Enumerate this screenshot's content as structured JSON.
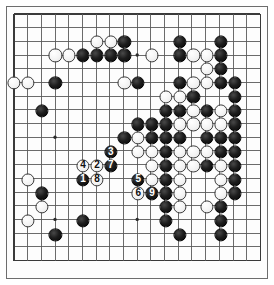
{
  "figure": {
    "kind": "go-board-diagram",
    "board_size": 19,
    "colors": {
      "board_background": "#fdfdfd",
      "page_background": "#ffffff",
      "grid_line": "#5a5a5a",
      "border": "#6d6d6d",
      "black_stone": "#141414",
      "white_stone": "#f7f7f7",
      "black_label_text": "#ffffff",
      "white_label_text": "#111111"
    },
    "geometry": {
      "left_px": 13,
      "top_px": 13,
      "spacing_px": 13.8,
      "stone_diameter_px": 13.2,
      "star_radius_px": 1.7
    },
    "star_points": [
      {
        "col": 4,
        "row": 4
      },
      {
        "col": 10,
        "row": 4
      },
      {
        "col": 16,
        "row": 4
      },
      {
        "col": 4,
        "row": 10
      },
      {
        "col": 10,
        "row": 10
      },
      {
        "col": 16,
        "row": 10
      },
      {
        "col": 4,
        "row": 16
      },
      {
        "col": 10,
        "row": 16
      },
      {
        "col": 16,
        "row": 16
      }
    ]
  },
  "stones": {
    "black": [
      {
        "col": 9,
        "row": 3
      },
      {
        "col": 13,
        "row": 3
      },
      {
        "col": 16,
        "row": 3
      },
      {
        "col": 6,
        "row": 4
      },
      {
        "col": 7,
        "row": 4
      },
      {
        "col": 8,
        "row": 4
      },
      {
        "col": 9,
        "row": 4
      },
      {
        "col": 13,
        "row": 4
      },
      {
        "col": 16,
        "row": 4
      },
      {
        "col": 16,
        "row": 5
      },
      {
        "col": 4,
        "row": 6
      },
      {
        "col": 13,
        "row": 6
      },
      {
        "col": 10,
        "row": 6
      },
      {
        "col": 17,
        "row": 6
      },
      {
        "col": 17,
        "row": 7
      },
      {
        "col": 14,
        "row": 7
      },
      {
        "col": 3,
        "row": 8
      },
      {
        "col": 12,
        "row": 8
      },
      {
        "col": 13,
        "row": 8
      },
      {
        "col": 15,
        "row": 8
      },
      {
        "col": 17,
        "row": 8
      },
      {
        "col": 11,
        "row": 9
      },
      {
        "col": 12,
        "row": 9
      },
      {
        "col": 17,
        "row": 9
      },
      {
        "col": 10,
        "row": 9
      },
      {
        "col": 11,
        "row": 10
      },
      {
        "col": 12,
        "row": 10
      },
      {
        "col": 13,
        "row": 10
      },
      {
        "col": 15,
        "row": 10
      },
      {
        "col": 16,
        "row": 10
      },
      {
        "col": 17,
        "row": 10
      },
      {
        "col": 9,
        "row": 10
      },
      {
        "col": 12,
        "row": 11
      },
      {
        "col": 16,
        "row": 11
      },
      {
        "col": 17,
        "row": 11
      },
      {
        "col": 12,
        "row": 12
      },
      {
        "col": 15,
        "row": 12
      },
      {
        "col": 17,
        "row": 12
      },
      {
        "col": 12,
        "row": 13
      },
      {
        "col": 17,
        "row": 13
      },
      {
        "col": 12,
        "row": 14
      },
      {
        "col": 17,
        "row": 14
      },
      {
        "col": 12,
        "row": 15
      },
      {
        "col": 16,
        "row": 15
      },
      {
        "col": 12,
        "row": 16
      },
      {
        "col": 16,
        "row": 16
      },
      {
        "col": 13,
        "row": 17
      },
      {
        "col": 16,
        "row": 17
      },
      {
        "col": 3,
        "row": 14
      },
      {
        "col": 16,
        "row": 6
      },
      {
        "col": 6,
        "row": 16
      },
      {
        "col": 4,
        "row": 17
      }
    ],
    "white": [
      {
        "col": 7,
        "row": 3
      },
      {
        "col": 8,
        "row": 3
      },
      {
        "col": 4,
        "row": 4
      },
      {
        "col": 5,
        "row": 4
      },
      {
        "col": 11,
        "row": 4
      },
      {
        "col": 14,
        "row": 4
      },
      {
        "col": 15,
        "row": 4
      },
      {
        "col": 15,
        "row": 5
      },
      {
        "col": 1,
        "row": 6
      },
      {
        "col": 2,
        "row": 6
      },
      {
        "col": 12,
        "row": 7
      },
      {
        "col": 13,
        "row": 7
      },
      {
        "col": 9,
        "row": 6
      },
      {
        "col": 14,
        "row": 6
      },
      {
        "col": 15,
        "row": 6
      },
      {
        "col": 14,
        "row": 8
      },
      {
        "col": 16,
        "row": 8
      },
      {
        "col": 13,
        "row": 9
      },
      {
        "col": 14,
        "row": 9
      },
      {
        "col": 15,
        "row": 9
      },
      {
        "col": 16,
        "row": 9
      },
      {
        "col": 10,
        "row": 11
      },
      {
        "col": 11,
        "row": 11
      },
      {
        "col": 13,
        "row": 11
      },
      {
        "col": 14,
        "row": 11
      },
      {
        "col": 15,
        "row": 11
      },
      {
        "col": 11,
        "row": 12
      },
      {
        "col": 13,
        "row": 12
      },
      {
        "col": 14,
        "row": 12
      },
      {
        "col": 16,
        "row": 12
      },
      {
        "col": 11,
        "row": 13
      },
      {
        "col": 13,
        "row": 13
      },
      {
        "col": 16,
        "row": 13
      },
      {
        "col": 13,
        "row": 14
      },
      {
        "col": 16,
        "row": 14
      },
      {
        "col": 13,
        "row": 15
      },
      {
        "col": 15,
        "row": 15
      },
      {
        "col": 2,
        "row": 13
      },
      {
        "col": 3,
        "row": 15
      },
      {
        "col": 2,
        "row": 16
      },
      {
        "col": 10,
        "row": 10
      }
    ]
  },
  "move_sequence": [
    {
      "label": "1",
      "color": "black",
      "col": 6,
      "row": 13
    },
    {
      "label": "2",
      "color": "white",
      "col": 7,
      "row": 12
    },
    {
      "label": "3",
      "color": "black",
      "col": 8,
      "row": 11
    },
    {
      "label": "4",
      "color": "white",
      "col": 6,
      "row": 12
    },
    {
      "label": "5",
      "color": "black",
      "col": 10,
      "row": 13
    },
    {
      "label": "6",
      "color": "white",
      "col": 10,
      "row": 14
    },
    {
      "label": "7",
      "color": "black",
      "col": 8,
      "row": 12
    },
    {
      "label": "8",
      "color": "white",
      "col": 7,
      "row": 13
    },
    {
      "label": "9",
      "color": "black",
      "col": 11,
      "row": 14
    }
  ]
}
